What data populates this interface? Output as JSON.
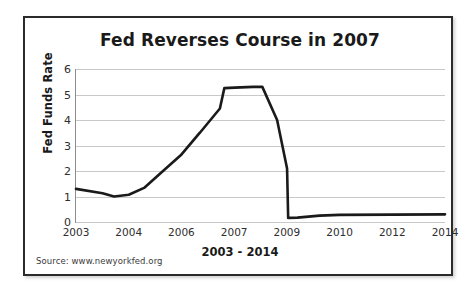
{
  "card": {
    "source_note": "Source: www.newyorkfed.org",
    "border_color": "#2b2b2b",
    "background": "#ffffff"
  },
  "chart_data": {
    "type": "line",
    "title": "Fed Reverses Course in 2007",
    "xlabel": "2003 - 2014",
    "ylabel": "Fed Funds Rate",
    "ylim": [
      0,
      6
    ],
    "yticks": [
      0,
      1,
      2,
      3,
      4,
      5,
      6
    ],
    "grid": true,
    "legend": "none",
    "xtick_labels": [
      "2003",
      "2004",
      "2006",
      "2007",
      "2009",
      "2010",
      "2012",
      "2014"
    ],
    "xtick_positions": [
      0.0,
      0.1429,
      0.2857,
      0.4286,
      0.5714,
      0.7143,
      0.8571,
      1.0
    ],
    "series": [
      {
        "name": "Fed Funds Rate",
        "color": "#1a1a1a",
        "points": [
          {
            "x": 0.0,
            "y": 1.3,
            "label": "2003"
          },
          {
            "x": 0.072,
            "y": 1.13
          },
          {
            "x": 0.103,
            "y": 1.0
          },
          {
            "x": 0.143,
            "y": 1.07,
            "label": "2004"
          },
          {
            "x": 0.186,
            "y": 1.35
          },
          {
            "x": 0.232,
            "y": 1.95
          },
          {
            "x": 0.286,
            "y": 2.65,
            "label": "2006"
          },
          {
            "x": 0.335,
            "y": 3.5
          },
          {
            "x": 0.286,
            "y": 2.65
          },
          {
            "x": 0.333,
            "y": 3.45
          },
          {
            "x": 0.333,
            "y": 3.45
          },
          {
            "x": 0.39,
            "y": 4.45
          },
          {
            "x": 0.402,
            "y": 5.25
          },
          {
            "x": 0.43,
            "y": 5.27
          },
          {
            "x": 0.48,
            "y": 5.3
          },
          {
            "x": 0.505,
            "y": 5.3
          },
          {
            "x": 0.545,
            "y": 4.0
          },
          {
            "x": 0.572,
            "y": 2.1
          },
          {
            "x": 0.575,
            "y": 0.16,
            "label": "2009"
          },
          {
            "x": 0.6,
            "y": 0.17
          },
          {
            "x": 0.66,
            "y": 0.25
          },
          {
            "x": 0.714,
            "y": 0.28,
            "label": "2010"
          },
          {
            "x": 0.857,
            "y": 0.29,
            "label": "2012"
          },
          {
            "x": 1.0,
            "y": 0.3,
            "label": "2014"
          }
        ],
        "values_summary": {
          "start_2003": 1.3,
          "trough_2003": 1.0,
          "peak_2006_2007": 5.3,
          "trough_2009": 0.16,
          "flat_2010_2014": 0.3
        }
      }
    ]
  }
}
